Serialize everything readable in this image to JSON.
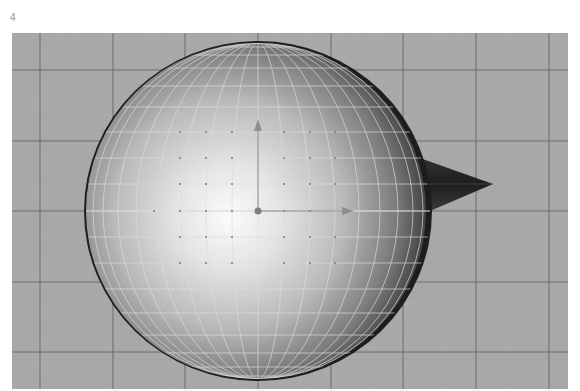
{
  "figure": {
    "label": "4"
  },
  "viewport": {
    "view": "front orthographic",
    "background_color": "#a9a9a9",
    "grid": {
      "minor_line_color": "#9c9c9c",
      "major_line_color": "#6c6c6c",
      "major_spacing_x": 72.7,
      "major_spacing_y": 70.5,
      "minor_divisions": 8
    },
    "objects": [
      {
        "type": "sphere",
        "name": "sphere-mesh",
        "center": [
          246,
          178
        ],
        "radius_x": 174,
        "radius_y": 169,
        "shading": "smooth gradient, light upper-left",
        "wireframe_color": "#d8d8d8"
      },
      {
        "type": "cone",
        "name": "cone-nose",
        "base_top": [
          410,
          126
        ],
        "apex": [
          481,
          150
        ],
        "base_bottom": [
          416,
          177
        ],
        "color": "#2a2a2a"
      }
    ],
    "manipulator": {
      "pivot": [
        246,
        178
      ],
      "y_arrow_tip": [
        246,
        88
      ],
      "x_arrow_tip": [
        342,
        178
      ],
      "color": "#8a8a8a"
    }
  }
}
